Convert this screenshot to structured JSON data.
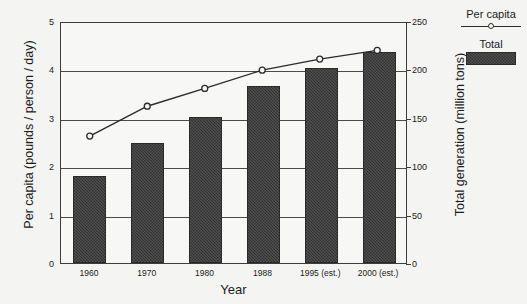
{
  "chart_data": {
    "type": "bar",
    "title": "",
    "xlabel": "Year",
    "ylabel": "Per capita (pounds / person / day)",
    "ylabel_right": "Total generation (million tons)",
    "categories": [
      "1960",
      "1970",
      "1980",
      "1988",
      "1995 (est.)",
      "2000 (est.)"
    ],
    "ylim": [
      0,
      5
    ],
    "yticks": [
      "0",
      "1",
      "2",
      "3",
      "4",
      "5"
    ],
    "ylim_right": [
      0,
      250
    ],
    "yticks_right": [
      "0",
      "50",
      "100",
      "150",
      "200",
      "250"
    ],
    "grid": true,
    "legend_position": "right",
    "series": [
      {
        "name": "Total",
        "type": "bar",
        "axis": "right",
        "unit": "million tons",
        "values": [
          88,
          122,
          151,
          180,
          200,
          218
        ],
        "values_left_axis": [
          1.79,
          2.47,
          3.02,
          3.65,
          4.02,
          4.37
        ]
      },
      {
        "name": "Per capita",
        "type": "line",
        "axis": "left",
        "unit": "pounds / person / day",
        "values": [
          2.65,
          3.27,
          3.64,
          4.02,
          4.25,
          4.43
        ]
      }
    ]
  },
  "legend": {
    "entries": [
      {
        "label": "Per capita",
        "key": "line-marker"
      },
      {
        "label": "Total",
        "key": "filled-swatch"
      }
    ]
  },
  "colors": {
    "bar_fill": "#3c3c3c",
    "axis": "#3d3d3d",
    "line": "#2b2b2b",
    "background": "#f4f4f2"
  }
}
